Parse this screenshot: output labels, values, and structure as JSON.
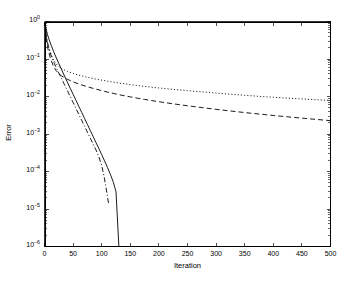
{
  "figure": {
    "background_color": "#ffffff",
    "axis_color": "#000000"
  },
  "chart_data": {
    "type": "line",
    "title": "",
    "subtitle": "",
    "xlabel": "Iteration",
    "ylabel": "Error",
    "xscale": "linear",
    "yscale": "log",
    "xlim": [
      0,
      500
    ],
    "ylim": [
      1e-06,
      1
    ],
    "grid": false,
    "legend": null,
    "legend_position": "none",
    "xticks": [
      0,
      50,
      100,
      150,
      200,
      250,
      300,
      350,
      400,
      450,
      500
    ],
    "xticklabels": [
      "0",
      "50",
      "100",
      "150",
      "200",
      "250",
      "300",
      "350",
      "400",
      "450",
      "500"
    ],
    "yticks": [
      1,
      0.1,
      0.01,
      0.001,
      0.0001,
      1e-05,
      1e-06
    ],
    "yticklabels": [
      "10^0",
      "10^-1",
      "10^-2",
      "10^-3",
      "10^-4",
      "10^-5",
      "10^-6"
    ],
    "yticklabel_mantissa": "10",
    "yticklabel_exponents": [
      "0",
      "-1",
      "-2",
      "-3",
      "-4",
      "-5",
      "-6"
    ],
    "minor_ticks": true,
    "series": [
      {
        "name": "solid-curve",
        "style": "solid",
        "color": "#000000",
        "linewidth": 0.9,
        "x": [
          0,
          2,
          5,
          8,
          12,
          16,
          20,
          25,
          30,
          35,
          40,
          45,
          50,
          55,
          60,
          65,
          70,
          75,
          80,
          85,
          90,
          95,
          100,
          105,
          110,
          115,
          120,
          125,
          130
        ],
        "y": [
          1.0,
          0.72,
          0.46,
          0.33,
          0.225,
          0.158,
          0.113,
          0.076,
          0.0515,
          0.0352,
          0.0241,
          0.0166,
          0.0115,
          0.0079,
          0.00546,
          0.00378,
          0.00261,
          0.00181,
          0.00125,
          0.00086,
          0.00059,
          0.00041,
          0.000282,
          0.000192,
          0.000129,
          8.5e-05,
          5.4e-05,
          2.9e-05,
          1e-06
        ]
      },
      {
        "name": "dash-dot-curve",
        "style": "dashdot",
        "color": "#000000",
        "linewidth": 0.9,
        "x": [
          0,
          2,
          5,
          8,
          12,
          16,
          20,
          25,
          30,
          35,
          40,
          45,
          50,
          55,
          60,
          65,
          70,
          75,
          80,
          85,
          90,
          95,
          100,
          104,
          108,
          112
        ],
        "y": [
          1.0,
          0.53,
          0.285,
          0.183,
          0.118,
          0.083,
          0.0615,
          0.0425,
          0.0296,
          0.0206,
          0.0143,
          0.00995,
          0.00692,
          0.00481,
          0.00334,
          0.00232,
          0.00162,
          0.00112,
          0.00078,
          0.00054,
          0.000376,
          0.000245,
          0.000145,
          7.6e-05,
          3.4e-05,
          1.4e-05
        ]
      },
      {
        "name": "dotted-curve",
        "style": "dotted",
        "color": "#000000",
        "linewidth": 0.9,
        "x": [
          0,
          3,
          6,
          10,
          15,
          20,
          25,
          30,
          40,
          50,
          60,
          75,
          90,
          110,
          130,
          150,
          175,
          200,
          225,
          250,
          275,
          300,
          325,
          350,
          375,
          400,
          425,
          450,
          475,
          500
        ],
        "y": [
          1.0,
          0.42,
          0.24,
          0.152,
          0.1005,
          0.0755,
          0.0625,
          0.0552,
          0.0468,
          0.0412,
          0.0371,
          0.0325,
          0.0291,
          0.0256,
          0.0229,
          0.0208,
          0.0186,
          0.0169,
          0.0155,
          0.0143,
          0.0133,
          0.0124,
          0.0115,
          0.0108,
          0.0101,
          0.00955,
          0.00905,
          0.00862,
          0.00822,
          0.00785
        ]
      },
      {
        "name": "dashed-curve",
        "style": "dashed",
        "color": "#000000",
        "linewidth": 0.9,
        "x": [
          0,
          3,
          6,
          10,
          15,
          20,
          25,
          30,
          40,
          50,
          60,
          75,
          90,
          110,
          130,
          150,
          175,
          200,
          225,
          250,
          275,
          300,
          325,
          350,
          375,
          400,
          425,
          450,
          475,
          500
        ],
        "y": [
          1.0,
          0.36,
          0.185,
          0.109,
          0.0678,
          0.0497,
          0.0406,
          0.0352,
          0.0288,
          0.0246,
          0.0216,
          0.0182,
          0.0157,
          0.0131,
          0.0112,
          0.00975,
          0.00835,
          0.00726,
          0.00638,
          0.00566,
          0.00506,
          0.00455,
          0.00411,
          0.00373,
          0.00341,
          0.00312,
          0.00287,
          0.00265,
          0.00245,
          0.00227
        ]
      }
    ]
  },
  "axes": {
    "xlabel_text": "Iteration",
    "ylabel_text": "Error"
  }
}
